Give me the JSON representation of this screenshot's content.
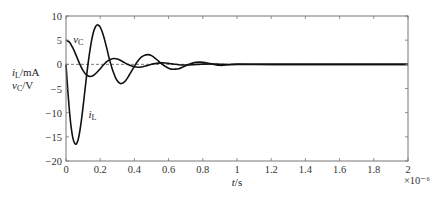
{
  "chart_data": {
    "type": "line",
    "title": "",
    "xlabel": "t/s",
    "xlabel_italic_part": "t",
    "xlabel_unit": "/s",
    "x_multiplier": "×10⁻⁶",
    "ylabel_lines": [
      "iL/mA",
      "vC/V"
    ],
    "ylabel_parts": [
      {
        "sym": "i",
        "sub": "L",
        "unit": "/mA"
      },
      {
        "sym": "v",
        "sub": "C",
        "unit": "/V"
      }
    ],
    "xlim": [
      0,
      2
    ],
    "ylim": [
      -20,
      10
    ],
    "xticks": [
      0,
      0.2,
      0.4,
      0.6,
      0.8,
      1,
      1.2,
      1.4,
      1.6,
      1.8,
      2
    ],
    "xtick_labels": [
      "0",
      "0.2",
      "0.4",
      "0.6",
      "0.8",
      "1",
      "1.2",
      "1.4",
      "1.6",
      "1.8",
      "2"
    ],
    "yticks": [
      10,
      5,
      0,
      -5,
      -10,
      -15,
      -20
    ],
    "ytick_labels": [
      "10",
      "5",
      "0",
      "−5",
      "−10",
      "−15",
      "−20"
    ],
    "zero_line": "dashed",
    "grid": false,
    "legend": "none (inline labels)",
    "series": [
      {
        "name": "vC",
        "label_sym": "v",
        "label_sub": "C",
        "label_anchor": [
          0.03,
          4.4
        ],
        "x": [
          0,
          0.02,
          0.04,
          0.06,
          0.08,
          0.1,
          0.12,
          0.14,
          0.16,
          0.18,
          0.2,
          0.22,
          0.24,
          0.26,
          0.28,
          0.3,
          0.32,
          0.34,
          0.36,
          0.38,
          0.4,
          0.42,
          0.44,
          0.46,
          0.48,
          0.5,
          0.52,
          0.54,
          0.56,
          0.58,
          0.6,
          0.62,
          0.64,
          0.66,
          0.68,
          0.7,
          0.72,
          0.74,
          0.76,
          0.78,
          0.8,
          0.85,
          0.9,
          0.95,
          1.0,
          1.2,
          1.4,
          1.6,
          1.8,
          2.0
        ],
        "values": [
          5,
          4.6,
          3.4,
          1.8,
          0.1,
          -1.3,
          -2.2,
          -2.5,
          -2.3,
          -1.7,
          -0.9,
          -0.1,
          0.6,
          1.0,
          1.2,
          1.1,
          0.8,
          0.4,
          0.0,
          -0.3,
          -0.5,
          -0.6,
          -0.55,
          -0.4,
          -0.2,
          0.0,
          0.15,
          0.25,
          0.3,
          0.28,
          0.2,
          0.1,
          0.0,
          -0.08,
          -0.13,
          -0.15,
          -0.13,
          -0.09,
          -0.04,
          0.0,
          0.04,
          0.07,
          0.03,
          -0.03,
          -0.02,
          0.0,
          0.0,
          0.0,
          0.0,
          0.0
        ]
      },
      {
        "name": "iL",
        "label_sym": "i",
        "label_sub": "L",
        "label_anchor": [
          0.12,
          -11.2
        ],
        "x": [
          0,
          0.01,
          0.02,
          0.03,
          0.04,
          0.05,
          0.06,
          0.07,
          0.08,
          0.09,
          0.1,
          0.11,
          0.12,
          0.13,
          0.14,
          0.15,
          0.16,
          0.17,
          0.18,
          0.19,
          0.2,
          0.21,
          0.22,
          0.23,
          0.24,
          0.25,
          0.26,
          0.27,
          0.28,
          0.29,
          0.3,
          0.31,
          0.32,
          0.33,
          0.34,
          0.35,
          0.36,
          0.37,
          0.38,
          0.4,
          0.42,
          0.44,
          0.46,
          0.48,
          0.5,
          0.52,
          0.54,
          0.56,
          0.58,
          0.6,
          0.62,
          0.64,
          0.66,
          0.68,
          0.7,
          0.72,
          0.74,
          0.76,
          0.78,
          0.8,
          0.85,
          0.9,
          0.95,
          1.0,
          1.2,
          1.4,
          1.6,
          1.8,
          2.0
        ],
        "values": [
          0,
          -5.2,
          -9.6,
          -13.0,
          -15.2,
          -16.3,
          -16.5,
          -15.7,
          -14.0,
          -11.6,
          -8.7,
          -5.6,
          -2.5,
          0.4,
          2.9,
          5.0,
          6.6,
          7.6,
          8.1,
          8.1,
          7.7,
          6.9,
          5.8,
          4.5,
          3.1,
          1.6,
          0.3,
          -0.9,
          -1.9,
          -2.8,
          -3.4,
          -3.8,
          -4.0,
          -3.9,
          -3.7,
          -3.3,
          -2.8,
          -2.2,
          -1.6,
          -0.4,
          0.7,
          1.5,
          1.9,
          2.0,
          1.8,
          1.3,
          0.7,
          0.1,
          -0.4,
          -0.8,
          -1.0,
          -1.0,
          -0.9,
          -0.6,
          -0.3,
          0.0,
          0.25,
          0.4,
          0.45,
          0.4,
          0.1,
          -0.2,
          -0.1,
          0.05,
          0.0,
          0.0,
          0.0,
          0.0,
          0.0
        ]
      }
    ]
  }
}
